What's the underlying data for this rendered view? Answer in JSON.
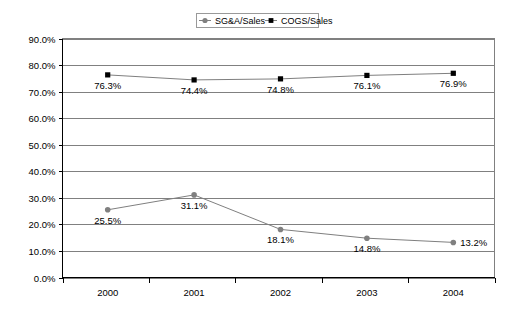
{
  "chart_data": {
    "type": "line",
    "title": "",
    "xlabel": "",
    "ylabel": "",
    "categories": [
      "2000",
      "2001",
      "2002",
      "2003",
      "2004"
    ],
    "ylim": [
      0,
      90
    ],
    "ytick_labels": [
      "0.0%",
      "10.0%",
      "20.0%",
      "30.0%",
      "40.0%",
      "50.0%",
      "60.0%",
      "70.0%",
      "80.0%",
      "90.0%"
    ],
    "ytick_values": [
      0,
      10,
      20,
      30,
      40,
      50,
      60,
      70,
      80,
      90
    ],
    "grid": true,
    "legend_position": "top-center",
    "series": [
      {
        "name": "SG&A/Sales",
        "marker": "circle",
        "color": "#808080",
        "values": [
          25.5,
          31.1,
          18.1,
          14.8,
          13.2
        ],
        "data_labels": [
          "25.5%",
          "31.1%",
          "18.1%",
          "14.8%",
          "13.2%"
        ]
      },
      {
        "name": "COGS/Sales",
        "marker": "square",
        "color": "#000000",
        "values": [
          76.3,
          74.4,
          74.8,
          76.1,
          76.9
        ],
        "data_labels": [
          "76.3%",
          "74.4%",
          "74.8%",
          "76.1%",
          "76.9%"
        ]
      }
    ]
  },
  "legend": {
    "items": [
      {
        "label": "SG&A/Sales",
        "marker": "circle-marker"
      },
      {
        "label": "COGS/Sales",
        "marker": "square-marker"
      }
    ]
  },
  "colors": {
    "series_sga": "#808080",
    "series_cogs": "#000000",
    "gridline": "#808080",
    "axis": "#000000",
    "background": "#ffffff"
  }
}
